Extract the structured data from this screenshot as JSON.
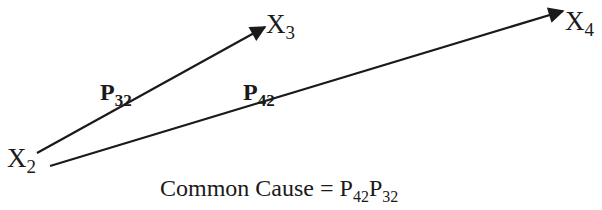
{
  "diagram": {
    "type": "path-diagram",
    "nodes": [
      {
        "id": "X2",
        "base": "X",
        "sub": "2"
      },
      {
        "id": "X3",
        "base": "X",
        "sub": "3"
      },
      {
        "id": "X4",
        "base": "X",
        "sub": "4"
      }
    ],
    "edges": [
      {
        "from": "X2",
        "to": "X3",
        "label_base": "P",
        "label_sub": "32"
      },
      {
        "from": "X2",
        "to": "X4",
        "label_base": "P",
        "label_sub": "42"
      }
    ],
    "caption": {
      "text": "Common Cause = ",
      "term1_base": "P",
      "term1_sub": "42",
      "term2_base": "P",
      "term2_sub": "32"
    },
    "colors": {
      "ink": "#1a1a1a",
      "background": "#ffffff"
    }
  }
}
